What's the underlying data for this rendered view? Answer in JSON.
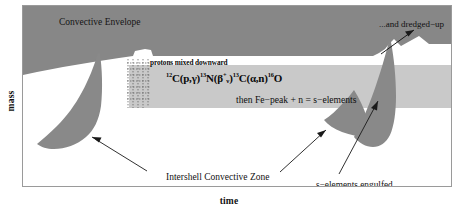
{
  "figure": {
    "title_axes": {
      "y_axis_label": "mass",
      "x_axis_label": "time"
    },
    "colors": {
      "envelope_fill": "#878787",
      "blob_fill": "#898989",
      "band_fill": "#c9c9c9",
      "background": "#ffffff",
      "frame_border": "#9a9a9a",
      "text": "#0d0d0d",
      "arrow": "#1a1a1a"
    },
    "labels": {
      "convective_envelope": "Convective Envelope",
      "dredged_up": "...and dredged−up",
      "protons_mixed_downward": "protons mixed downward",
      "reaction_chain": {
        "sup1": "12",
        "c1": "C(p,γ)",
        "sup2": "13",
        "n1": "N(β",
        "supplus": "+",
        "subnu": "ν",
        "close1": ")",
        "sup3": "13",
        "c2": "C(α,n)",
        "sup4": "16",
        "o1": "O",
        "plain_text": "12C(p,γ)13N(β+ν)13C(α,n)16O"
      },
      "fe_peak_line": "then Fe−peak + n = s−elements",
      "intershell_convective_zone": "Intershell Convective Zone",
      "s_elements_engulfed": "s−elements engulfed..."
    },
    "annotations": {
      "arrow_to_dredged_up": "arrow pointing up-right from envelope notch toward dredged-up label",
      "arrow_to_left_blob": "arrow from Intershell Convective Zone label to left convective blob",
      "arrow_to_right_blob_lower": "arrow from Intershell Convective Zone label to right lower blob",
      "arrow_to_right_blob_main": "arrow from s-elements engulfed label to right main blob"
    }
  }
}
